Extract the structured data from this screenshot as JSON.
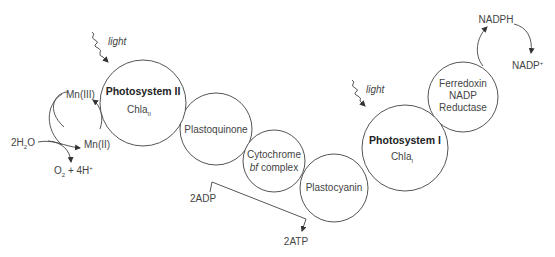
{
  "diagram": {
    "nodes": {
      "photosystem2": {
        "name": "Photosystem II",
        "sub_base": "Chla",
        "sub_index": "II"
      },
      "plastoquinone": {
        "name": "Plastoquinone"
      },
      "cytochrome": {
        "line1": "Cytochrome",
        "line2_italic": "bf",
        "line2_rest": " complex"
      },
      "plastocyanin": {
        "name": "Plastocyanin"
      },
      "photosystem1": {
        "name": "Photosystem I",
        "sub_base": "Chla",
        "sub_index": "I"
      },
      "ferredoxin": {
        "line1": "Ferredoxin",
        "line2": "NADP",
        "line3": "Reductase"
      }
    },
    "light_labels": {
      "ps2": "light",
      "ps1": "light"
    },
    "water_cycle": {
      "mn3": "Mn(III)",
      "mn2": "Mn(II)",
      "water": {
        "base1": "2H",
        "sub": "2",
        "base2": "O"
      },
      "products": {
        "o": "O",
        "sub": "2",
        "rest": " + 4H",
        "sup": "+"
      }
    },
    "atp": {
      "adp": "2ADP",
      "atp": "2ATP"
    },
    "nadp_cycle": {
      "nadph": "NADPH",
      "nadp": "NADP",
      "sup": "+"
    }
  }
}
